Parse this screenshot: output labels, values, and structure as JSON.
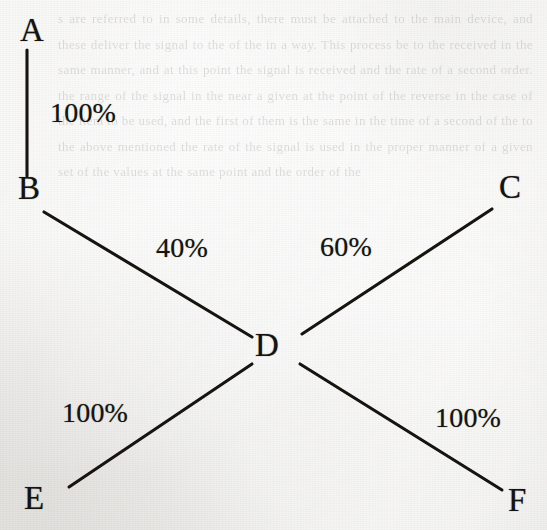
{
  "figure": {
    "type": "node-link-diagram",
    "background_color": "#e9e8e4",
    "ink_color": "#17140f",
    "ghost_text": "s are referred to in some details, there must be attached to the main device, and these deliver the signal to the of the in a way. This process be to the received in the same manner, and at this point the signal is received and the rate of a second order. the range of the signal in the near a given at the point of the reverse in the case of the item to be used, and the first of them is the same in the time of a second of the to the above mentioned the rate of the signal is used in the proper manner of a given set of the values at the same point and the order of the"
  },
  "graph": {
    "nodes": [
      {
        "id": "A",
        "label": "A",
        "x": 20,
        "y": 14
      },
      {
        "id": "B",
        "label": "B",
        "x": 18,
        "y": 172
      },
      {
        "id": "C",
        "label": "C",
        "x": 499,
        "y": 171
      },
      {
        "id": "D",
        "label": "D",
        "x": 255,
        "y": 329
      },
      {
        "id": "E",
        "label": "E",
        "x": 24,
        "y": 482
      },
      {
        "id": "F",
        "label": "F",
        "x": 508,
        "y": 484
      }
    ],
    "edges": [
      {
        "id": "A-B",
        "from": "A",
        "to": "B",
        "label": "100%",
        "x1": 27,
        "y1": 50,
        "x2": 27,
        "y2": 176,
        "label_x": 50,
        "label_y": 99
      },
      {
        "id": "B-D",
        "from": "B",
        "to": "D",
        "label": "40%",
        "x1": 44,
        "y1": 212,
        "x2": 252,
        "y2": 337,
        "label_x": 156,
        "label_y": 234
      },
      {
        "id": "D-C",
        "from": "D",
        "to": "C",
        "label": "60%",
        "x1": 302,
        "y1": 334,
        "x2": 492,
        "y2": 209,
        "label_x": 320,
        "label_y": 233
      },
      {
        "id": "E-D",
        "from": "E",
        "to": "D",
        "label": "100%",
        "x1": 69,
        "y1": 487,
        "x2": 252,
        "y2": 364,
        "label_x": 62,
        "label_y": 399
      },
      {
        "id": "D-F",
        "from": "D",
        "to": "F",
        "label": "100%",
        "x1": 300,
        "y1": 364,
        "x2": 502,
        "y2": 490,
        "label_x": 435,
        "label_y": 404
      }
    ]
  }
}
